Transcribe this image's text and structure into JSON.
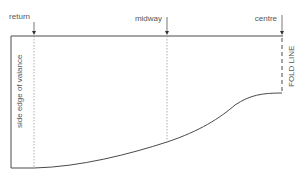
{
  "diagram": {
    "markers": [
      {
        "id": "return",
        "label": "return"
      },
      {
        "id": "midway",
        "label": "midway"
      },
      {
        "id": "centre",
        "label": "centre"
      }
    ],
    "side_edge_label": "side edge of valance",
    "fold_line_label": "FOLD LINE",
    "colors": {
      "line": "#4a4a4a",
      "guide": "#9a9a9a",
      "text": "#555555"
    }
  }
}
